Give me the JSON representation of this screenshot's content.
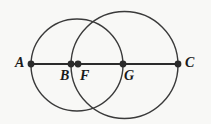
{
  "figure": {
    "name": "two-overlapping-circles-with-collinear-points",
    "background_color": "#f8f8f6",
    "stroke_color": "#3a3a3a",
    "point_color": "#2b2b2b",
    "label_color": "#1a1a1a",
    "line": {
      "name": "segment-AC",
      "x1": 31,
      "y1": 64,
      "x2": 178,
      "y2": 64,
      "stroke_width": 2.2
    },
    "circles": [
      {
        "name": "left-circle",
        "cx": 77,
        "cy": 65,
        "r": 46,
        "stroke_width": 1.4
      },
      {
        "name": "right-circle",
        "cx": 124.5,
        "cy": 65,
        "r": 53.5,
        "stroke_width": 1.4
      }
    ],
    "points": [
      {
        "id": "A",
        "label": "A",
        "x": 31,
        "y": 64,
        "r": 3.4,
        "label_x": 15,
        "label_y": 56
      },
      {
        "id": "B",
        "label": "B",
        "x": 71,
        "y": 64,
        "r": 3.4,
        "label_x": 60,
        "label_y": 69
      },
      {
        "id": "F",
        "label": "F",
        "x": 78,
        "y": 64,
        "r": 3.4,
        "label_x": 80,
        "label_y": 69
      },
      {
        "id": "G",
        "label": "G",
        "x": 123,
        "y": 64,
        "r": 3.4,
        "label_x": 124,
        "label_y": 69
      },
      {
        "id": "C",
        "label": "C",
        "x": 178,
        "y": 64,
        "r": 3.4,
        "label_x": 185,
        "label_y": 56
      }
    ]
  }
}
